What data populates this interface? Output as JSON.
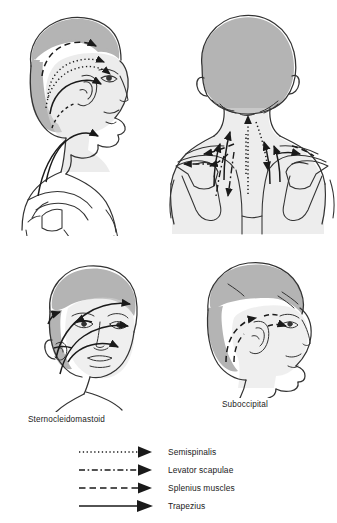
{
  "figures": [
    {
      "id": "upper-left",
      "name": "lateral-head-neck-trapezius-splenius",
      "view": "lateral head and neck with shoulder, facing right",
      "arrow_types": [
        "splenius muscles",
        "semispinalis",
        "trapezius"
      ]
    },
    {
      "id": "upper-right",
      "name": "posterior-head-neck-upper-back",
      "view": "posterior head, neck and upper back with scapulae",
      "arrow_types": [
        "semispinalis",
        "levator scapulae",
        "splenius muscles",
        "trapezius"
      ]
    },
    {
      "id": "lower-left",
      "name": "anterior-oblique-face-sternocleidomastoid",
      "view": "three-quarter anterior face and neck",
      "arrow_types": [
        "trapezius"
      ]
    },
    {
      "id": "lower-right",
      "name": "lateral-head-suboccipital",
      "view": "lateral head facing right",
      "arrow_types": [
        "splenius muscles"
      ]
    }
  ],
  "captions": {
    "sternocleidomastoid": "Sternocleidomastoid",
    "suboccipital": "Suboccipital"
  },
  "legend": {
    "items": [
      {
        "label": "Semispinalis",
        "style": "dotted",
        "icon": "dotted-arrow-icon"
      },
      {
        "label": "Levator scapulae",
        "style": "dashdot",
        "icon": "dashdot-arrow-icon"
      },
      {
        "label": "Splenius muscles",
        "style": "dashed",
        "icon": "dashed-arrow-icon"
      },
      {
        "label": "Trapezius",
        "style": "solid",
        "icon": "solid-arrow-icon"
      }
    ]
  },
  "colors": {
    "ink": "#1a1a1a",
    "outline": "#333333",
    "hair_shade": "#b4b4b4",
    "skin_shade": "#dcdcdc",
    "background": "#ffffff"
  }
}
